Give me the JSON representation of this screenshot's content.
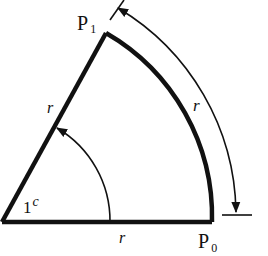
{
  "diagram": {
    "title": "",
    "colors": {
      "stroke": "#111111",
      "background": "#ffffff"
    },
    "labels": {
      "p1_main": "P",
      "p1_sub": "1",
      "p0_main": "P",
      "p0_sub": "0",
      "radius_side": "r",
      "radius_base": "r",
      "arc_length": "r",
      "angle_value": "1",
      "angle_unit": "c"
    }
  }
}
